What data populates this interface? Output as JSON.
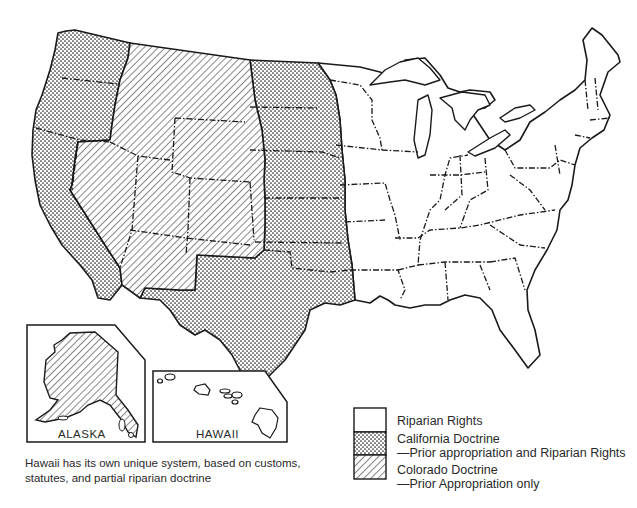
{
  "map": {
    "title": "Water rights doctrines by state",
    "categories": [
      {
        "id": "riparian",
        "label": "Riparian Rights",
        "pattern": "blank"
      },
      {
        "id": "california",
        "label": "California Doctrine",
        "sublabel": "—Prior appropriation and Riparian Rights",
        "pattern": "dots"
      },
      {
        "id": "colorado",
        "label": "Colorado Doctrine",
        "sublabel": "—Prior Appropriation only",
        "pattern": "hatch"
      }
    ],
    "regions": {
      "california_doctrine": [
        "Washington",
        "Oregon",
        "California",
        "North Dakota",
        "South Dakota",
        "Nebraska",
        "Kansas",
        "Oklahoma",
        "Texas"
      ],
      "colorado_doctrine": [
        "Montana",
        "Idaho",
        "Wyoming",
        "Nevada",
        "Utah",
        "Colorado",
        "Arizona",
        "New Mexico",
        "Alaska"
      ],
      "riparian_rights": [
        "Eastern states (Minnesota eastward)"
      ]
    },
    "insets": {
      "alaska": "ALASKA",
      "hawaii": "HAWAII"
    },
    "caption": "Hawaii has its own unique system, based on customs, statutes, and partial riparian doctrine",
    "colors": {
      "ink": "#1a1a1a",
      "background": "#ffffff"
    }
  }
}
